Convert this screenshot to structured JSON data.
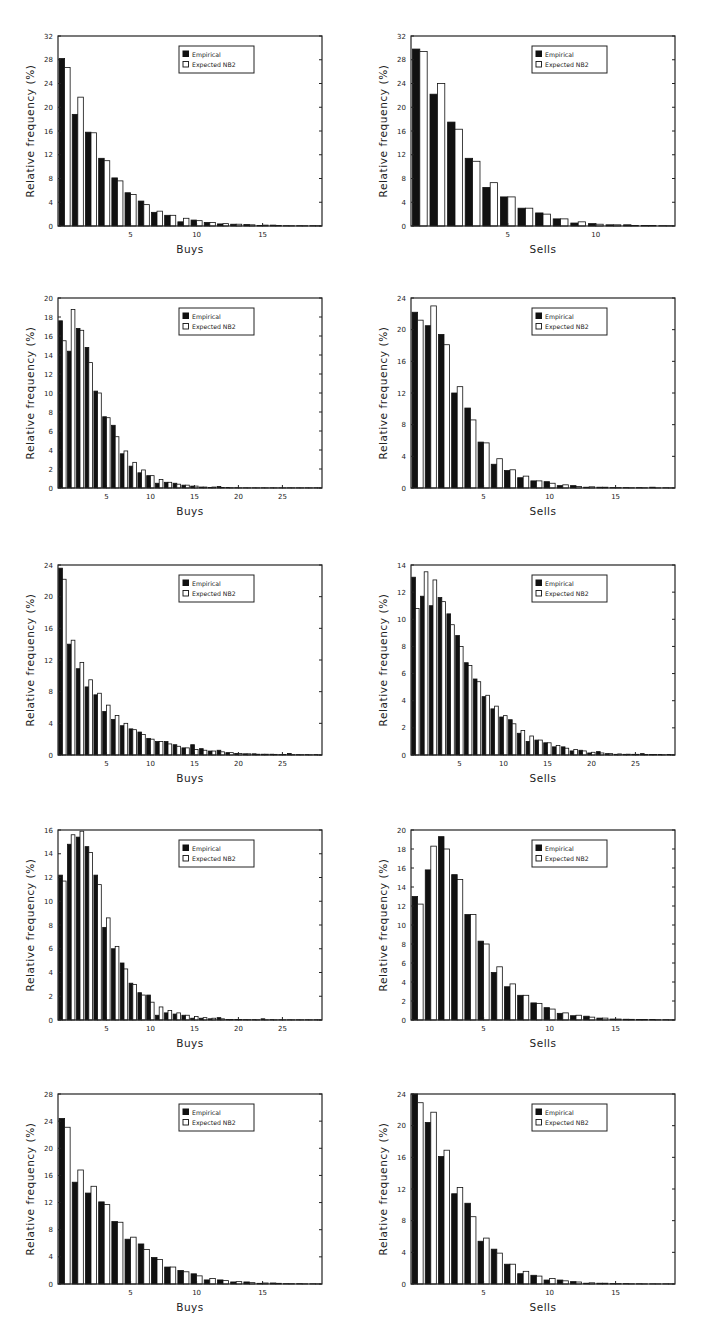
{
  "legend": {
    "empirical": "Empirical",
    "expected": "Expected NB2"
  },
  "ylabel": "Relative frequency (%)",
  "colors": {
    "empirical": "#111111",
    "expected": "#ffffff",
    "frame": "#222222"
  },
  "chart_data": [
    {
      "type": "bar",
      "id": "p1",
      "position": "row1-left",
      "xlabel": "Buys",
      "ylabel": "Relative frequency (%)",
      "ylim": [
        0,
        32
      ],
      "yticks": [
        0,
        4,
        8,
        12,
        16,
        20,
        24,
        28,
        32
      ],
      "xlim": [
        0,
        20
      ],
      "xticks": [
        5,
        10,
        15
      ],
      "legend_position": "upper-right",
      "grid": false,
      "categories": [
        0,
        1,
        2,
        3,
        4,
        5,
        6,
        7,
        8,
        9,
        10,
        11,
        12,
        13,
        14,
        15,
        16,
        17,
        18,
        19
      ],
      "series": [
        {
          "name": "Empirical",
          "values": [
            28.2,
            18.8,
            15.8,
            11.4,
            8.1,
            5.6,
            4.2,
            2.3,
            1.8,
            0.7,
            1.0,
            0.6,
            0.35,
            0.3,
            0.25,
            0.1,
            0.15,
            0.05,
            0.05,
            0.05
          ]
        },
        {
          "name": "Expected NB2",
          "values": [
            26.7,
            21.7,
            15.7,
            11.0,
            7.6,
            5.3,
            3.6,
            2.5,
            1.8,
            1.3,
            0.9,
            0.6,
            0.4,
            0.3,
            0.2,
            0.15,
            0.1,
            0.05,
            0.05,
            0.05
          ]
        }
      ]
    },
    {
      "type": "bar",
      "id": "p2",
      "position": "row1-right",
      "xlabel": "Sells",
      "ylabel": "Relative frequency (%)",
      "ylim": [
        0,
        32
      ],
      "yticks": [
        0,
        4,
        8,
        12,
        16,
        20,
        24,
        28,
        32
      ],
      "xlim": [
        0,
        15
      ],
      "xticks": [
        5,
        10
      ],
      "legend_position": "upper-right",
      "grid": false,
      "categories": [
        0,
        1,
        2,
        3,
        4,
        5,
        6,
        7,
        8,
        9,
        10,
        11,
        12,
        13,
        14
      ],
      "series": [
        {
          "name": "Empirical",
          "values": [
            29.8,
            22.2,
            17.5,
            11.4,
            6.5,
            4.9,
            3.0,
            2.2,
            1.2,
            0.5,
            0.4,
            0.2,
            0.2,
            0.1,
            0.05
          ]
        },
        {
          "name": "Expected NB2",
          "values": [
            29.4,
            24.0,
            16.3,
            10.9,
            7.3,
            4.9,
            3.0,
            2.0,
            1.2,
            0.7,
            0.3,
            0.2,
            0.1,
            0.1,
            0.05
          ]
        }
      ]
    },
    {
      "type": "bar",
      "id": "p3",
      "position": "row2-left",
      "xlabel": "Buys",
      "ylabel": "Relative frequency (%)",
      "ylim": [
        0,
        20
      ],
      "yticks": [
        0,
        2,
        4,
        6,
        8,
        10,
        12,
        14,
        16,
        18,
        20
      ],
      "xlim": [
        0,
        30
      ],
      "xticks": [
        5,
        10,
        15,
        20,
        25
      ],
      "legend_position": "upper-right",
      "grid": false,
      "categories": [
        0,
        1,
        2,
        3,
        4,
        5,
        6,
        7,
        8,
        9,
        10,
        11,
        12,
        13,
        14,
        15,
        16,
        17,
        18,
        19,
        20,
        21,
        22,
        23,
        24,
        25,
        26,
        27,
        28,
        29
      ],
      "series": [
        {
          "name": "Empirical",
          "values": [
            17.6,
            14.4,
            16.8,
            14.8,
            10.2,
            7.5,
            6.6,
            3.6,
            2.3,
            1.6,
            1.3,
            0.5,
            0.6,
            0.5,
            0.3,
            0.2,
            0.1,
            0.05,
            0.15,
            0.05,
            0.03,
            0.02,
            0.02,
            0.02,
            0.02,
            0.02,
            0.02,
            0.02,
            0.02,
            0.02
          ]
        },
        {
          "name": "Expected NB2",
          "values": [
            15.5,
            18.8,
            16.6,
            13.2,
            10.0,
            7.4,
            5.4,
            3.9,
            2.7,
            1.9,
            1.3,
            0.9,
            0.6,
            0.4,
            0.3,
            0.2,
            0.1,
            0.1,
            0.05,
            0.03,
            0.02,
            0.02,
            0.02,
            0.02,
            0.02,
            0.02,
            0.02,
            0.02,
            0.02,
            0.02
          ]
        }
      ]
    },
    {
      "type": "bar",
      "id": "p4",
      "position": "row2-right",
      "xlabel": "Sells",
      "ylabel": "Relative frequency (%)",
      "ylim": [
        0,
        24
      ],
      "yticks": [
        0,
        4,
        8,
        12,
        16,
        20,
        24
      ],
      "xlim": [
        0,
        20
      ],
      "xticks": [
        5,
        10,
        15
      ],
      "legend_position": "upper-right",
      "grid": false,
      "categories": [
        0,
        1,
        2,
        3,
        4,
        5,
        6,
        7,
        8,
        9,
        10,
        11,
        12,
        13,
        14,
        15,
        16,
        17,
        18,
        19
      ],
      "series": [
        {
          "name": "Empirical",
          "values": [
            22.2,
            20.5,
            19.4,
            12.0,
            10.1,
            5.8,
            3.0,
            2.2,
            1.3,
            0.9,
            0.8,
            0.3,
            0.3,
            0.1,
            0.1,
            0.05,
            0.05,
            0.05,
            0.1,
            0.03
          ]
        },
        {
          "name": "Expected NB2",
          "values": [
            21.2,
            23.0,
            18.1,
            12.8,
            8.6,
            5.7,
            3.7,
            2.3,
            1.5,
            0.9,
            0.6,
            0.4,
            0.2,
            0.15,
            0.1,
            0.05,
            0.03,
            0.03,
            0.02,
            0.02
          ]
        }
      ]
    },
    {
      "type": "bar",
      "id": "p5",
      "position": "row3-left",
      "xlabel": "Buys",
      "ylabel": "Relative frequency (%)",
      "ylim": [
        0,
        24
      ],
      "yticks": [
        0,
        4,
        8,
        12,
        16,
        20,
        24
      ],
      "xlim": [
        0,
        30
      ],
      "xticks": [
        5,
        10,
        15,
        20,
        25
      ],
      "legend_position": "upper-right",
      "grid": false,
      "categories": [
        0,
        1,
        2,
        3,
        4,
        5,
        6,
        7,
        8,
        9,
        10,
        11,
        12,
        13,
        14,
        15,
        16,
        17,
        18,
        19,
        20,
        21,
        22,
        23,
        24,
        25,
        26,
        27,
        28,
        29
      ],
      "series": [
        {
          "name": "Empirical",
          "values": [
            23.6,
            14.0,
            10.9,
            8.6,
            7.6,
            5.5,
            4.5,
            3.7,
            3.3,
            2.9,
            2.1,
            1.7,
            1.7,
            1.3,
            0.9,
            1.3,
            0.8,
            0.5,
            0.6,
            0.3,
            0.2,
            0.15,
            0.15,
            0.1,
            0.1,
            0.05,
            0.2,
            0.05,
            0.05,
            0.05
          ]
        },
        {
          "name": "Expected NB2",
          "values": [
            22.2,
            14.5,
            11.7,
            9.5,
            7.8,
            6.3,
            5.0,
            4.0,
            3.2,
            2.6,
            2.0,
            1.7,
            1.4,
            1.1,
            0.9,
            0.7,
            0.6,
            0.5,
            0.4,
            0.3,
            0.2,
            0.15,
            0.1,
            0.1,
            0.08,
            0.06,
            0.05,
            0.04,
            0.03,
            0.02
          ]
        }
      ]
    },
    {
      "type": "bar",
      "id": "p6",
      "position": "row3-right",
      "xlabel": "Sells",
      "ylabel": "Relative frequency (%)",
      "ylim": [
        0,
        14
      ],
      "yticks": [
        0,
        2,
        4,
        6,
        8,
        10,
        12,
        14
      ],
      "xlim": [
        0,
        30
      ],
      "xticks": [
        5,
        10,
        15,
        20,
        25
      ],
      "legend_position": "upper-right",
      "grid": false,
      "categories": [
        0,
        1,
        2,
        3,
        4,
        5,
        6,
        7,
        8,
        9,
        10,
        11,
        12,
        13,
        14,
        15,
        16,
        17,
        18,
        19,
        20,
        21,
        22,
        23,
        24,
        25,
        26,
        27,
        28,
        29
      ],
      "series": [
        {
          "name": "Empirical",
          "values": [
            13.1,
            11.7,
            11.0,
            11.6,
            10.4,
            8.8,
            6.8,
            5.6,
            4.3,
            3.4,
            2.8,
            2.6,
            1.6,
            1.0,
            1.1,
            0.9,
            0.6,
            0.6,
            0.3,
            0.35,
            0.15,
            0.25,
            0.1,
            0.05,
            0.05,
            0.05,
            0.1,
            0.03,
            0.03,
            0.03
          ]
        },
        {
          "name": "Expected NB2",
          "values": [
            10.8,
            13.5,
            12.9,
            11.3,
            9.6,
            8.0,
            6.6,
            5.4,
            4.4,
            3.6,
            2.9,
            2.3,
            1.8,
            1.4,
            1.1,
            0.9,
            0.7,
            0.5,
            0.4,
            0.3,
            0.2,
            0.15,
            0.1,
            0.08,
            0.06,
            0.05,
            0.04,
            0.03,
            0.02,
            0.02
          ]
        }
      ]
    },
    {
      "type": "bar",
      "id": "p7",
      "position": "row4-left",
      "xlabel": "Buys",
      "ylabel": "Relative frequency (%)",
      "ylim": [
        0,
        16
      ],
      "yticks": [
        0,
        2,
        4,
        6,
        8,
        10,
        12,
        14,
        16
      ],
      "xlim": [
        0,
        30
      ],
      "xticks": [
        5,
        10,
        15,
        20,
        25
      ],
      "legend_position": "upper-right",
      "grid": false,
      "categories": [
        0,
        1,
        2,
        3,
        4,
        5,
        6,
        7,
        8,
        9,
        10,
        11,
        12,
        13,
        14,
        15,
        16,
        17,
        18,
        19,
        20,
        21,
        22,
        23,
        24,
        25,
        26,
        27,
        28,
        29
      ],
      "series": [
        {
          "name": "Empirical",
          "values": [
            12.2,
            14.8,
            15.4,
            14.6,
            12.2,
            7.8,
            6.0,
            4.8,
            3.1,
            2.3,
            2.1,
            0.4,
            0.6,
            0.5,
            0.4,
            0.15,
            0.15,
            0.1,
            0.2,
            0.05,
            0.05,
            0.03,
            0.03,
            0.1,
            0.03,
            0.02,
            0.02,
            0.02,
            0.02,
            0.02
          ]
        },
        {
          "name": "Expected NB2",
          "values": [
            11.7,
            15.6,
            15.9,
            14.1,
            11.4,
            8.6,
            6.2,
            4.3,
            3.0,
            2.1,
            1.5,
            1.1,
            0.8,
            0.6,
            0.4,
            0.3,
            0.2,
            0.15,
            0.1,
            0.05,
            0.04,
            0.03,
            0.02,
            0.02,
            0.02,
            0.02,
            0.02,
            0.02,
            0.02,
            0.02
          ]
        }
      ]
    },
    {
      "type": "bar",
      "id": "p8",
      "position": "row4-right",
      "xlabel": "Sells",
      "ylabel": "Relative frequency (%)",
      "ylim": [
        0,
        20
      ],
      "yticks": [
        0,
        2,
        4,
        6,
        8,
        10,
        12,
        14,
        16,
        18,
        20
      ],
      "xlim": [
        0,
        20
      ],
      "xticks": [
        5,
        10,
        15
      ],
      "legend_position": "upper-right",
      "grid": false,
      "categories": [
        0,
        1,
        2,
        3,
        4,
        5,
        6,
        7,
        8,
        9,
        10,
        11,
        12,
        13,
        14,
        15,
        16,
        17,
        18,
        19
      ],
      "series": [
        {
          "name": "Empirical",
          "values": [
            13.0,
            15.8,
            19.3,
            15.3,
            11.1,
            8.3,
            5.0,
            3.5,
            2.6,
            1.8,
            1.3,
            0.7,
            0.45,
            0.4,
            0.2,
            0.1,
            0.08,
            0.05,
            0.05,
            0.03
          ]
        },
        {
          "name": "Expected NB2",
          "values": [
            12.2,
            18.3,
            18.0,
            14.8,
            11.1,
            8.0,
            5.6,
            3.8,
            2.6,
            1.75,
            1.15,
            0.75,
            0.5,
            0.3,
            0.2,
            0.1,
            0.07,
            0.05,
            0.03,
            0.02
          ]
        }
      ]
    },
    {
      "type": "bar",
      "id": "p9",
      "position": "row5-left",
      "xlabel": "Buys",
      "ylabel": "Relative frequency (%)",
      "ylim": [
        0,
        28
      ],
      "yticks": [
        0,
        4,
        8,
        12,
        16,
        20,
        24,
        28
      ],
      "xlim": [
        0,
        20
      ],
      "xticks": [
        5,
        10,
        15
      ],
      "legend_position": "upper-right",
      "grid": false,
      "categories": [
        0,
        1,
        2,
        3,
        4,
        5,
        6,
        7,
        8,
        9,
        10,
        11,
        12,
        13,
        14,
        15,
        16,
        17,
        18,
        19
      ],
      "series": [
        {
          "name": "Empirical",
          "values": [
            24.4,
            15.0,
            13.4,
            12.1,
            9.2,
            6.6,
            5.9,
            3.9,
            2.5,
            2.0,
            1.5,
            0.6,
            0.6,
            0.3,
            0.3,
            0.1,
            0.15,
            0.05,
            0.05,
            0.03
          ]
        },
        {
          "name": "Expected NB2",
          "values": [
            23.1,
            16.8,
            14.4,
            11.7,
            9.1,
            6.9,
            5.1,
            3.6,
            2.5,
            1.8,
            1.2,
            0.8,
            0.5,
            0.35,
            0.2,
            0.15,
            0.1,
            0.05,
            0.03,
            0.02
          ]
        }
      ]
    },
    {
      "type": "bar",
      "id": "p10",
      "position": "row5-right",
      "xlabel": "Sells",
      "ylabel": "Relative frequency (%)",
      "ylim": [
        0,
        24
      ],
      "yticks": [
        0,
        4,
        8,
        12,
        16,
        20,
        24
      ],
      "xlim": [
        0,
        20
      ],
      "xticks": [
        5,
        10,
        15
      ],
      "legend_position": "upper-right",
      "grid": false,
      "categories": [
        0,
        1,
        2,
        3,
        4,
        5,
        6,
        7,
        8,
        9,
        10,
        11,
        12,
        13,
        14,
        15,
        16,
        17,
        18,
        19
      ],
      "series": [
        {
          "name": "Empirical",
          "values": [
            24.0,
            20.4,
            16.1,
            11.4,
            10.2,
            5.4,
            4.4,
            2.5,
            1.3,
            1.1,
            0.5,
            0.5,
            0.3,
            0.1,
            0.1,
            0.05,
            0.05,
            0.03,
            0.02,
            0.02
          ]
        },
        {
          "name": "Expected NB2",
          "values": [
            22.9,
            21.7,
            16.9,
            12.2,
            8.5,
            5.8,
            3.9,
            2.5,
            1.6,
            1.0,
            0.7,
            0.4,
            0.25,
            0.15,
            0.1,
            0.05,
            0.03,
            0.02,
            0.02,
            0.02
          ]
        }
      ]
    }
  ]
}
